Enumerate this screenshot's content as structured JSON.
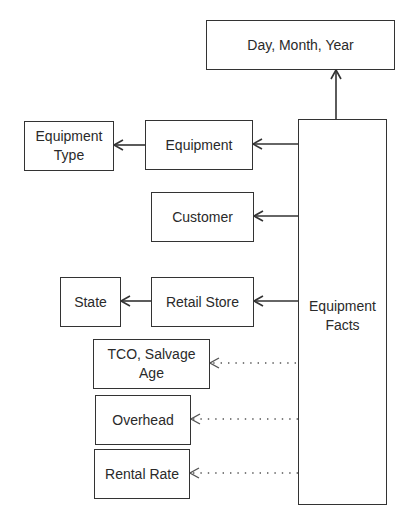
{
  "diagram": {
    "type": "star-schema",
    "line_color": "#333333",
    "background": "#ffffff",
    "nodes": {
      "date": {
        "label": "Day, Month, Year"
      },
      "equipment_type": {
        "label": "Equipment\nType"
      },
      "equipment": {
        "label": "Equipment"
      },
      "customer": {
        "label": "Customer"
      },
      "state": {
        "label": "State"
      },
      "retail_store": {
        "label": "Retail Store"
      },
      "tco": {
        "label": "TCO, Salvage\nAge"
      },
      "overhead": {
        "label": "Overhead"
      },
      "rental_rate": {
        "label": "Rental Rate"
      },
      "fact": {
        "label": "Equipment\nFacts"
      }
    },
    "edges": [
      {
        "from": "Equipment Facts",
        "to": "Day, Month, Year",
        "style": "solid"
      },
      {
        "from": "Equipment Facts",
        "to": "Equipment",
        "style": "solid"
      },
      {
        "from": "Equipment",
        "to": "Equipment Type",
        "style": "solid"
      },
      {
        "from": "Equipment Facts",
        "to": "Customer",
        "style": "solid"
      },
      {
        "from": "Equipment Facts",
        "to": "Retail Store",
        "style": "solid"
      },
      {
        "from": "Retail Store",
        "to": "State",
        "style": "solid"
      },
      {
        "from": "Equipment Facts",
        "to": "TCO, Salvage Age",
        "style": "dotted"
      },
      {
        "from": "Equipment Facts",
        "to": "Overhead",
        "style": "dotted"
      },
      {
        "from": "Equipment Facts",
        "to": "Rental Rate",
        "style": "dotted"
      }
    ]
  }
}
